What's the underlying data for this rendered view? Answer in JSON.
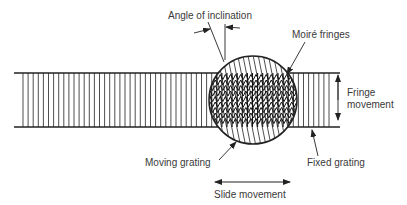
{
  "diagram": {
    "labels": {
      "angle": "Angle of inclination",
      "moire": "Moiré fringes",
      "fringe_line1": "Fringe",
      "fringe_line2": "movement",
      "moving": "Moving grating",
      "fixed": "Fixed grating",
      "slide": "Slide movement"
    },
    "colors": {
      "ink": "#222222",
      "text": "#3a3a3a",
      "background": "#ffffff"
    }
  }
}
